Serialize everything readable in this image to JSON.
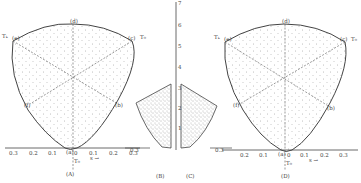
{
  "figure": {
    "panels": [
      {
        "id": "A",
        "caption": "(A)",
        "point_labels": {
          "top": "(d)",
          "upper_left": "(e)",
          "upper_right": "(c)",
          "lower_left": "(f)",
          "lower_right": "(b)",
          "origin": "(a)"
        },
        "left_arrow_label": "Tₖ",
        "right_arrow_label": "T₀",
        "x_ticks_left": [
          "0.3",
          "0.2",
          "0.1"
        ],
        "x_ticks_right": [
          "0",
          "0.1",
          "0.2",
          "0.3"
        ],
        "x_axis_label": "s →",
        "origin_label": "T₀"
      },
      {
        "id": "B",
        "caption": "(B)"
      },
      {
        "id": "C",
        "caption": "(C)"
      },
      {
        "id": "D",
        "caption": "(D)",
        "point_labels": {
          "top": "(d)",
          "upper_left": "(e)",
          "upper_right": "(c)",
          "lower_left": "(f)",
          "lower_right": "(b)",
          "origin": "(a)"
        },
        "left_arrow_label": "Tₖ",
        "right_arrow_label": "T₀",
        "x_ticks_left": [
          "0.3",
          "0.2",
          "0.1"
        ],
        "x_ticks_right": [
          "0",
          "0.1",
          "0.2",
          "0.3"
        ],
        "x_axis_label": "s →",
        "origin_label": "T₀"
      }
    ],
    "central_axis": {
      "ticks": [
        "7",
        "6",
        "5",
        "4",
        "3",
        "2",
        "1"
      ]
    },
    "side_tick_left": "0.3",
    "side_tick_right": "0.3"
  }
}
